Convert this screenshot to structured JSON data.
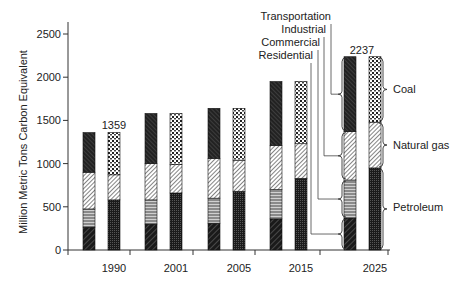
{
  "chart_data": {
    "type": "bar",
    "subtype": "paired stacked bars (by end-use sector and by fuel)",
    "title": "",
    "ylabel": "Million Metric Tons Carbon Equivalent",
    "xlabel": "",
    "ylim": [
      0,
      2500
    ],
    "yticks": [
      0,
      500,
      1000,
      1500,
      2000,
      2500
    ],
    "grid": false,
    "categories": [
      "1990",
      "2001",
      "2005",
      "2015",
      "2025"
    ],
    "sector_series": [
      {
        "name": "Residential",
        "values": [
          265,
          300,
          310,
          360,
          370
        ],
        "pattern": "dark-diagonal"
      },
      {
        "name": "Commercial",
        "values": [
          210,
          280,
          290,
          340,
          440
        ],
        "pattern": "gray-horizontal"
      },
      {
        "name": "Industrial",
        "values": [
          425,
          420,
          460,
          510,
          560
        ],
        "pattern": "light-diagonal"
      },
      {
        "name": "Transportation",
        "values": [
          459,
          580,
          580,
          740,
          867
        ],
        "pattern": "dark-hatch"
      }
    ],
    "fuel_series": [
      {
        "name": "Petroleum",
        "values": [
          580,
          660,
          680,
          830,
          950
        ],
        "pattern": "dark-dots"
      },
      {
        "name": "Natural gas",
        "values": [
          290,
          330,
          360,
          400,
          530
        ],
        "pattern": "light-diagonal"
      },
      {
        "name": "Coal",
        "values": [
          489,
          590,
          600,
          720,
          757
        ],
        "pattern": "coarse-dots"
      }
    ],
    "totals": [
      1359,
      1580,
      1640,
      1950,
      2237
    ],
    "annotations": [
      {
        "text": "1359",
        "category": "1990"
      },
      {
        "text": "2237",
        "category": "2025"
      }
    ],
    "sector_legend": [
      "Transportation",
      "Industrial",
      "Commercial",
      "Residential"
    ],
    "fuel_legend": [
      "Coal",
      "Natural gas",
      "Petroleum"
    ],
    "legend_position": "right, bracketed on 2025 bars"
  },
  "labels": {
    "ylabel": "Million Metric Tons Carbon Equivalent",
    "total_1990": "1359",
    "total_2025": "2237",
    "sector_transportation": "Transportation",
    "sector_industrial": "Industrial",
    "sector_commercial": "Commercial",
    "sector_residential": "Residential",
    "fuel_coal": "Coal",
    "fuel_natural_gas": "Natural gas",
    "fuel_petroleum": "Petroleum"
  }
}
